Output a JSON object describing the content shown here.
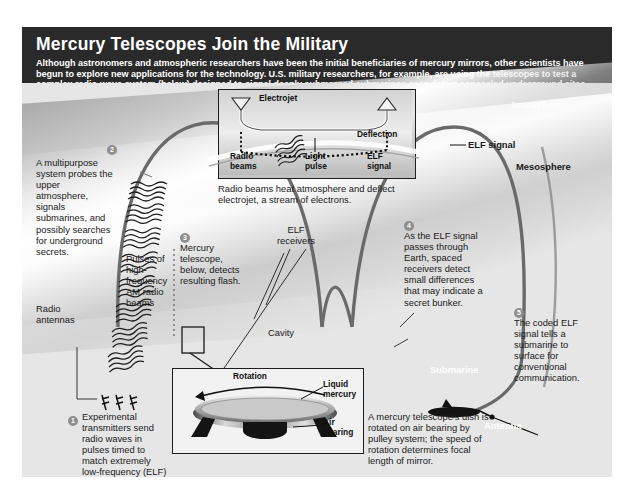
{
  "header": {
    "title": "Mercury Telescopes Join the Military",
    "deck": "Although astronomers and atmospheric researchers have been the initial beneficiaries of mercury mirrors, other scientists have begun to explore new applications for the technology. U.S. military researchers, for example, are using the telescopes to test a complex radio-wave system (below) designed to signal deeply submerged submarines or to detect concealed underground sites."
  },
  "callouts": [
    {
      "number": "1",
      "text": "Experimental transmitters send radio waves in pulses timed to match extremely low-frequency (ELF) signal."
    },
    {
      "number": "2",
      "text": "A multipurpose system probes the upper atmosphere, signals submarines, and possibly searches for underground secrets."
    },
    {
      "number": "3",
      "text": "Mercury telescope, below, detects resulting flash."
    },
    {
      "number": "4",
      "text": "As the ELF signal passes through Earth, spaced receivers detect small differences that may indicate a secret bunker."
    },
    {
      "number": "5",
      "text": "The coded ELF signal tells a submarine to surface for conventional communication."
    }
  ],
  "labels": {
    "pulses": "Pulses of high-frequency AM radio beams",
    "radio_antennas": "Radio antennas",
    "ionosphere": "Ionosphere",
    "mesosphere": "Mesosphere",
    "elf_signal": "ELF signal",
    "elf_receivers": "ELF receivers",
    "cavity": "Cavity",
    "submarine": "Submarine",
    "antenna": "Antenna"
  },
  "top_inset": {
    "electrojet": "Electrojet",
    "deflection": "Deflection",
    "radio_beams": "Radio beams",
    "light_pulse": "Light pulse",
    "elf_signal": "ELF signal",
    "caption": "Radio beams heat atmosphere and deflect electrojet, a stream of electrons."
  },
  "bottom_inset": {
    "rotation": "Rotation",
    "liquid_mercury": "Liquid mercury",
    "air_bearing": "Air bearing",
    "caption": "A mercury telescope's dish is rotated on air bearing by pulley system; the speed of rotation determines focal length of mirror."
  },
  "colors": {
    "header_bg": "#2a2a2a",
    "panel_bg": "#e9e9e9",
    "stroke": "#5a5a5a",
    "text": "#1a1a1a"
  }
}
